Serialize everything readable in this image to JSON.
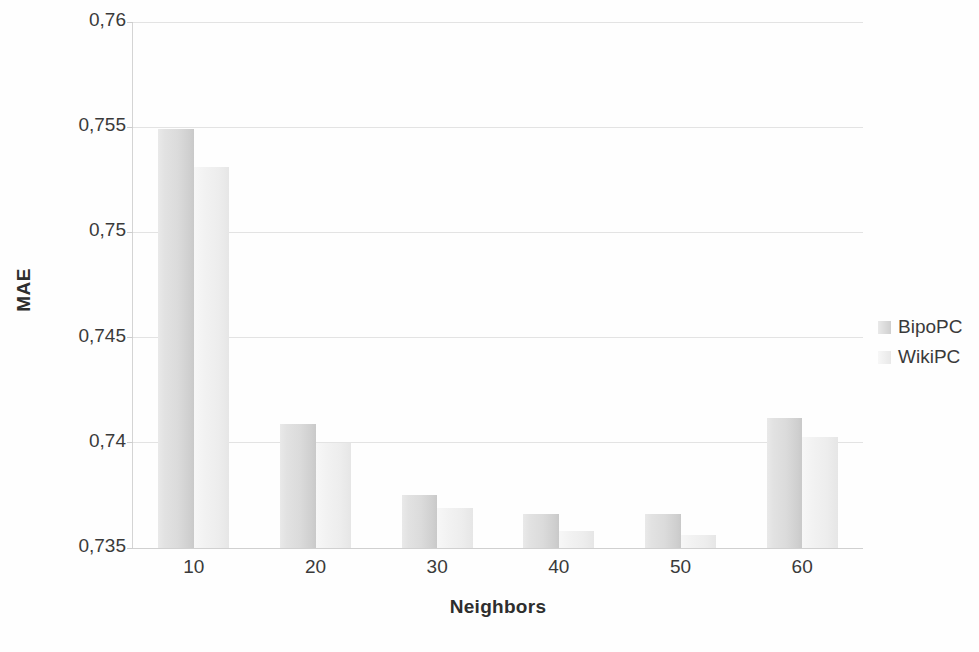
{
  "chart_data": {
    "type": "bar",
    "title": "",
    "xlabel": "Neighbors",
    "ylabel": "MAE",
    "categories": [
      "10",
      "20",
      "30",
      "40",
      "50",
      "60"
    ],
    "series": [
      {
        "name": "BipoPC",
        "values": [
          0.7549,
          0.7409,
          0.7375,
          0.7366,
          0.7366,
          0.7412
        ],
        "color": "#dcdcdc"
      },
      {
        "name": "WikiPC",
        "values": [
          0.7531,
          0.74,
          0.7369,
          0.7358,
          0.7356,
          0.7403
        ],
        "color": "#f0f0f0"
      }
    ],
    "ylim": [
      0.735,
      0.76
    ],
    "y_ticks": [
      0.735,
      0.74,
      0.745,
      0.75,
      0.755,
      0.76
    ],
    "y_tick_labels": [
      "0,735",
      "0,74",
      "0,745",
      "0,75",
      "0,755",
      "0,76"
    ],
    "grid": true,
    "legend_position": "right",
    "decimal_separator": ","
  },
  "axes": {
    "y_title": "MAE",
    "x_title": "Neighbors"
  },
  "legend": {
    "entries": [
      {
        "label": "BipoPC",
        "swatch": "legend-swatch-bipopc"
      },
      {
        "label": "WikiPC",
        "swatch": "legend-swatch-wikipc"
      }
    ]
  }
}
